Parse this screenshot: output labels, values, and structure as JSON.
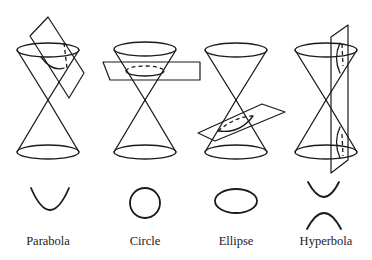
{
  "figure": {
    "panels": [
      {
        "id": "parabola",
        "label": "Parabola",
        "cx": 48
      },
      {
        "id": "circle",
        "label": "Circle",
        "cx": 145
      },
      {
        "id": "ellipse",
        "label": "Ellipse",
        "cx": 236
      },
      {
        "id": "hyperbola",
        "label": "Hyperbola",
        "cx": 326
      }
    ],
    "colors": {
      "stroke": "#1a1a1a",
      "background": "#ffffff"
    }
  }
}
